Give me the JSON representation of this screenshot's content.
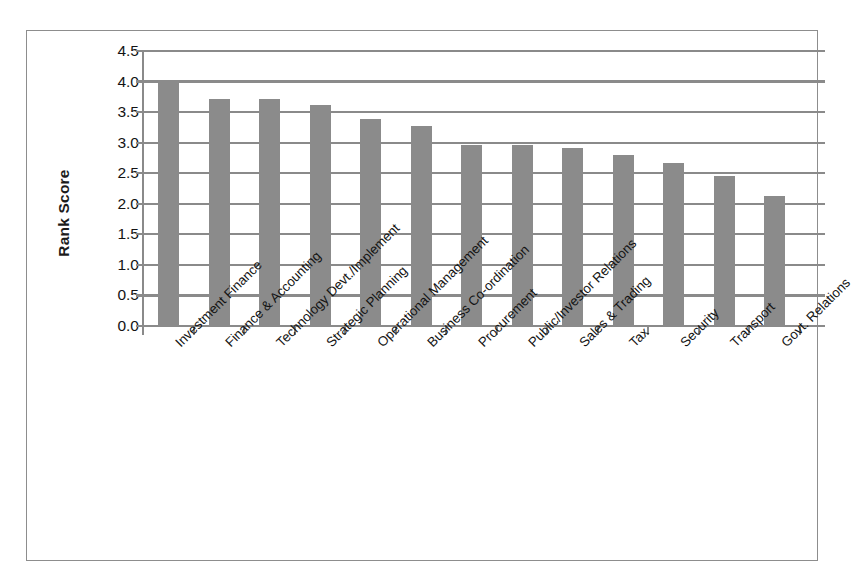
{
  "chart_data": {
    "type": "bar",
    "title": "",
    "xlabel": "",
    "ylabel": "Rank Score",
    "ylim": [
      0.0,
      4.5
    ],
    "ytick_step": 0.5,
    "grid": true,
    "legend": "none",
    "bar_color": "#8b8b8b",
    "axis_color": "#8a8a8a",
    "categories": [
      "Investment Finance",
      "Finance & Accounting",
      "Technology Devt./Implement",
      "Strategic Planning",
      "Operational Management",
      "Business Co-ordination",
      "Procurement",
      "Public/Investor Relations",
      "Sales & Trading",
      "Tax",
      "Security",
      "Transport",
      "Govt. Relations"
    ],
    "values": [
      4.02,
      3.72,
      3.71,
      3.61,
      3.38,
      3.28,
      2.97,
      2.97,
      2.92,
      2.8,
      2.67,
      2.46,
      2.12
    ],
    "ytick_labels": [
      "4.5",
      "4.0",
      "3.5",
      "3.0",
      "2.5",
      "2.0",
      "1.5",
      "1.0",
      "0.5",
      "0.0"
    ],
    "ytick_values": [
      4.5,
      4.0,
      3.5,
      3.0,
      2.5,
      2.0,
      1.5,
      1.0,
      0.5,
      0.0
    ]
  }
}
